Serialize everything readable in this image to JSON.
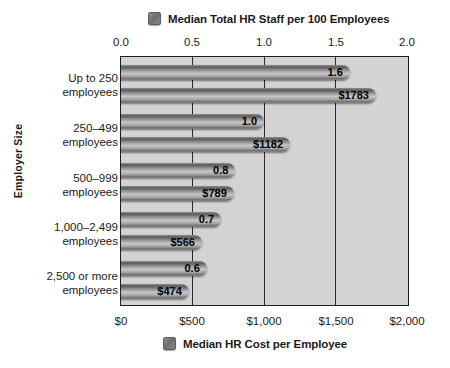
{
  "chart_data": {
    "type": "bar",
    "orientation": "horizontal",
    "title": "",
    "ylabel": "Employer Size",
    "categories": [
      "Up to 250\nemployees",
      "250–499\nemployees",
      "500–999\nemployees",
      "1,000–2,499\nemployees",
      "2,500 or more\nemployees"
    ],
    "series": [
      {
        "name": "Median Total HR Staff per 100 Employees",
        "axis": "top",
        "values": [
          1.6,
          1.0,
          0.8,
          0.7,
          0.6
        ],
        "labels": [
          "1.6",
          "1.0",
          "0.8",
          "0.7",
          "0.6"
        ]
      },
      {
        "name": "Median HR Cost per Employee",
        "axis": "bottom",
        "values": [
          1783,
          1182,
          789,
          566,
          474
        ],
        "labels": [
          "$1783",
          "$1182",
          "$789",
          "$566",
          "$474"
        ]
      }
    ],
    "top_axis": {
      "label": "Median Total HR Staff per 100 Employees",
      "ticks": [
        "0.0",
        "0.5",
        "1.0",
        "1.5",
        "2.0"
      ],
      "tick_values": [
        0.0,
        0.5,
        1.0,
        1.5,
        2.0
      ],
      "lim": [
        0.0,
        2.0
      ]
    },
    "bottom_axis": {
      "label": "Median HR Cost per Employee",
      "ticks": [
        "$0",
        "$500",
        "$1,000",
        "$1,500",
        "$2,000"
      ],
      "tick_values": [
        0,
        500,
        1000,
        1500,
        2000
      ],
      "lim": [
        0,
        2000
      ]
    },
    "grid": true,
    "legend_position": "top-and-bottom",
    "colors": {
      "bar": "#8a8a8a",
      "plot_background": "#d3d3d3",
      "axis": "#1e1e1e",
      "page_background": "#ffffff"
    }
  },
  "categories_display": [
    {
      "line1": "Up to 250",
      "line2": "employees"
    },
    {
      "line1": "250–499",
      "line2": "employees"
    },
    {
      "line1": "500–999",
      "line2": "employees"
    },
    {
      "line1": "1,000–2,499",
      "line2": "employees"
    },
    {
      "line1": "2,500 or more",
      "line2": "employees"
    }
  ],
  "legend_top": {
    "label": "Median Total HR Staff per 100 Employees",
    "swatch": "legend-swatch-icon"
  },
  "legend_bottom": {
    "label": "Median HR Cost per Employee",
    "swatch": "legend-swatch-icon"
  },
  "axis_titles": {
    "y": "Employer Size"
  }
}
